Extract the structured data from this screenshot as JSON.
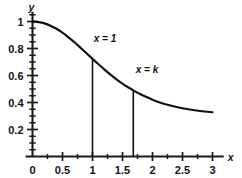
{
  "chart_data": {
    "type": "line",
    "title": "",
    "xlabel": "x",
    "ylabel": "y",
    "xlim": [
      0,
      3.12
    ],
    "ylim": [
      0,
      1.05
    ],
    "grid": false,
    "legend": null,
    "x_ticks": [
      0,
      0.5,
      1,
      1.5,
      2,
      2.5,
      3
    ],
    "x_tick_labels": [
      "0",
      "0.5",
      "1",
      "1.5",
      "2",
      "2.5",
      "3"
    ],
    "x_minor_step": 0.25,
    "y_ticks": [
      0.2,
      0.4,
      0.6,
      0.8,
      1
    ],
    "y_tick_labels": [
      "0.2",
      "0.4",
      "0.6",
      "0.8",
      "1"
    ],
    "y_minor_step": 0.05,
    "series": [
      {
        "name": "curve",
        "x": [
          0,
          0.1,
          0.2,
          0.3,
          0.4,
          0.5,
          0.6,
          0.7,
          0.8,
          0.9,
          1,
          1.1,
          1.2,
          1.3,
          1.4,
          1.5,
          1.6,
          1.68,
          1.8,
          1.9,
          2,
          2.1,
          2.2,
          2.4,
          2.6,
          2.8,
          3
        ],
        "y": [
          1,
          0.996,
          0.986,
          0.969,
          0.946,
          0.917,
          0.883,
          0.846,
          0.806,
          0.765,
          0.723,
          0.683,
          0.644,
          0.607,
          0.572,
          0.54,
          0.511,
          0.49,
          0.461,
          0.44,
          0.421,
          0.404,
          0.389,
          0.367,
          0.35,
          0.337,
          0.328
        ]
      }
    ],
    "annotations": [
      {
        "name": "x-equals-1",
        "label": "x = 1",
        "x": 1,
        "y_top": 0.723,
        "y_bottom": 0,
        "label_x": 1.02,
        "label_y": 0.845
      },
      {
        "name": "x-equals-k",
        "label": "x = k",
        "x": 1.68,
        "y_top": 0.49,
        "y_bottom": 0,
        "label_x": 1.72,
        "label_y": 0.615
      }
    ],
    "colors": {
      "curve": "#111111",
      "axis": "#1a1a1a",
      "background": "#ffffff"
    }
  }
}
